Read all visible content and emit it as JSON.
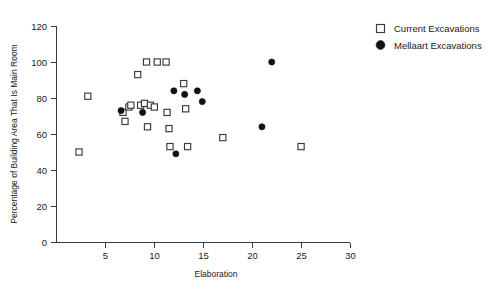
{
  "chart_data": {
    "type": "scatter",
    "title": "",
    "xlabel": "Elaboration",
    "ylabel": "Percentage of Building Area That Is Main Room",
    "xlim": [
      0,
      30
    ],
    "ylim": [
      0,
      120
    ],
    "xticks": [
      5,
      10,
      15,
      20,
      25,
      30
    ],
    "yticks": [
      0,
      20,
      40,
      60,
      80,
      100,
      120
    ],
    "grid": false,
    "legend_position": "top-right",
    "series": [
      {
        "name": "Current Excavations",
        "marker": "open-square",
        "color": "#3b3b3b",
        "points": [
          [
            2.3,
            50
          ],
          [
            3.2,
            81
          ],
          [
            6.8,
            72
          ],
          [
            7.0,
            67
          ],
          [
            7.4,
            75
          ],
          [
            7.6,
            76
          ],
          [
            8.3,
            93
          ],
          [
            8.6,
            76
          ],
          [
            9.0,
            77
          ],
          [
            9.2,
            100
          ],
          [
            9.3,
            64
          ],
          [
            9.6,
            76
          ],
          [
            10.0,
            75
          ],
          [
            10.3,
            100
          ],
          [
            11.2,
            100
          ],
          [
            11.3,
            72
          ],
          [
            11.5,
            63
          ],
          [
            11.6,
            53
          ],
          [
            13.0,
            88
          ],
          [
            13.2,
            74
          ],
          [
            13.4,
            53
          ],
          [
            17.0,
            58
          ],
          [
            25.0,
            53
          ]
        ]
      },
      {
        "name": "Mellaart Excavations",
        "marker": "filled-circle",
        "color": "#111111",
        "points": [
          [
            6.6,
            73
          ],
          [
            8.8,
            72
          ],
          [
            12.0,
            84
          ],
          [
            12.2,
            49
          ],
          [
            13.1,
            82
          ],
          [
            14.4,
            84
          ],
          [
            14.9,
            78
          ],
          [
            21.0,
            64
          ],
          [
            22.0,
            100
          ]
        ]
      }
    ]
  },
  "legend": {
    "entries": [
      {
        "label": "Current Excavations",
        "marker": "open-square"
      },
      {
        "label": "Mellaart Excavations",
        "marker": "filled-circle"
      }
    ]
  },
  "axes": {
    "x_title": "Elaboration",
    "y_title": "Percentage of Building Area That Is Main Room",
    "x_tick_labels": [
      "5",
      "10",
      "15",
      "20",
      "25",
      "30"
    ],
    "y_tick_labels": [
      "0",
      "20",
      "40",
      "60",
      "80",
      "100",
      "120"
    ]
  }
}
